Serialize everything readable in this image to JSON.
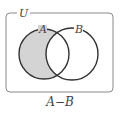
{
  "diagram": {
    "type": "venn",
    "universe_label": "U",
    "sets": [
      {
        "label": "A",
        "shaded": true
      },
      {
        "label": "B",
        "shaded": false
      }
    ],
    "caption": "A−B",
    "colors": {
      "shade": "#d4d4d4",
      "stroke": "#333333",
      "frame": "#8a8a8a"
    }
  }
}
